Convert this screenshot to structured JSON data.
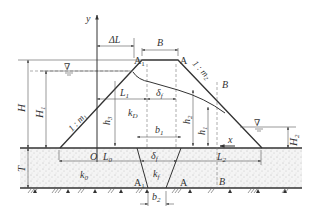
{
  "figure": {
    "type": "earth-dam-seepage-cross-section",
    "axes": {
      "y_label": "y",
      "x_label": "x",
      "origin_label": "O"
    },
    "dam": {
      "crest_width_label": "B",
      "offset_label": "ΔL",
      "upstream_slope_label": "1 : m",
      "upstream_slope_sub": "1",
      "downstream_slope_label": "1 : m",
      "downstream_slope_sub": "2",
      "crest_points": [
        "A",
        "A"
      ],
      "crest_point_sub": "1",
      "core_coefficient": "k",
      "core_coefficient_sub": "D",
      "section_label": "B"
    },
    "heights": {
      "H": "H",
      "H1": "H",
      "H1_sub": "1",
      "H2": "H",
      "H2_sub": "2",
      "h1": "h",
      "h1_sub": "1",
      "h2": "h",
      "h2_sub": "2",
      "h3": "h",
      "h3_sub": "3",
      "T": "T"
    },
    "lengths": {
      "L0": "L",
      "L0_sub": "0",
      "L1": "L",
      "L1_sub": "1",
      "L2": "L",
      "L2_sub": "2",
      "delta_f": "δ",
      "delta_f_sub": "f",
      "b1": "b",
      "b1_sub": "1",
      "b2": "b",
      "b2_sub": "2"
    },
    "foundation": {
      "coefficient": "k",
      "coefficient_sub": "0",
      "cutoff_coefficient": "k",
      "cutoff_coefficient_sub": "f",
      "points": [
        "A",
        "A",
        "B"
      ],
      "point_sub": "1"
    },
    "water_symbol": "∇"
  }
}
